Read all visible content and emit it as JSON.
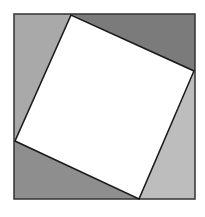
{
  "diagram": {
    "outer_square": {
      "x": 14,
      "y": 14,
      "width": 181,
      "height": 185,
      "stroke": "#333333"
    },
    "inner_square": {
      "points": "71,15 194,71 139,199 15,141",
      "fill": "#ffffff",
      "stroke": "#1a1a1a"
    },
    "triangles": [
      {
        "name": "top-left",
        "points": "14,14 71,14 15,141 14,141",
        "fill": "#a9a9a9"
      },
      {
        "name": "top-right",
        "points": "71,14 195,14 195,71 194,71",
        "fill": "#7b7b7b"
      },
      {
        "name": "bottom-right",
        "points": "195,71 195,199 139,199",
        "fill": "#bdbdbd"
      },
      {
        "name": "bottom-left",
        "points": "14,141 139,199 14,199",
        "fill": "#8e8e8e"
      }
    ]
  }
}
